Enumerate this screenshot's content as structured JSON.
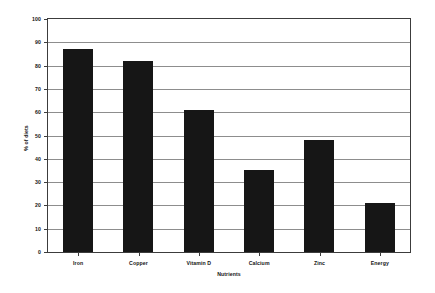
{
  "chart_data": {
    "type": "bar",
    "title": "",
    "subtitle": "",
    "xlabel": "Nutrients",
    "ylabel": "% of diets",
    "categories": [
      "Iron",
      "Copper",
      "Vitamin D",
      "Calcium",
      "Zinc",
      "Energy"
    ],
    "values": [
      87,
      82,
      61,
      35,
      48,
      21
    ],
    "series": [
      {
        "name": "% of diets",
        "values": [
          87,
          82,
          61,
          35,
          48,
          21
        ]
      }
    ],
    "ylim": [
      0,
      100
    ],
    "ytick_labels": [
      "0",
      "10",
      "20",
      "30",
      "40",
      "50",
      "60",
      "70",
      "80",
      "90",
      "100"
    ],
    "ytick_values": [
      0,
      10,
      20,
      30,
      40,
      50,
      60,
      70,
      80,
      90,
      100
    ],
    "grid": true,
    "grid_axis": "y",
    "legend": false,
    "legend_position": "none",
    "annotations": [],
    "colors": {
      "bar": "#161616",
      "gridline": "#8d8d8d",
      "axis": "#3c3c3c",
      "background": "#ffffff",
      "text": "#141414"
    }
  }
}
